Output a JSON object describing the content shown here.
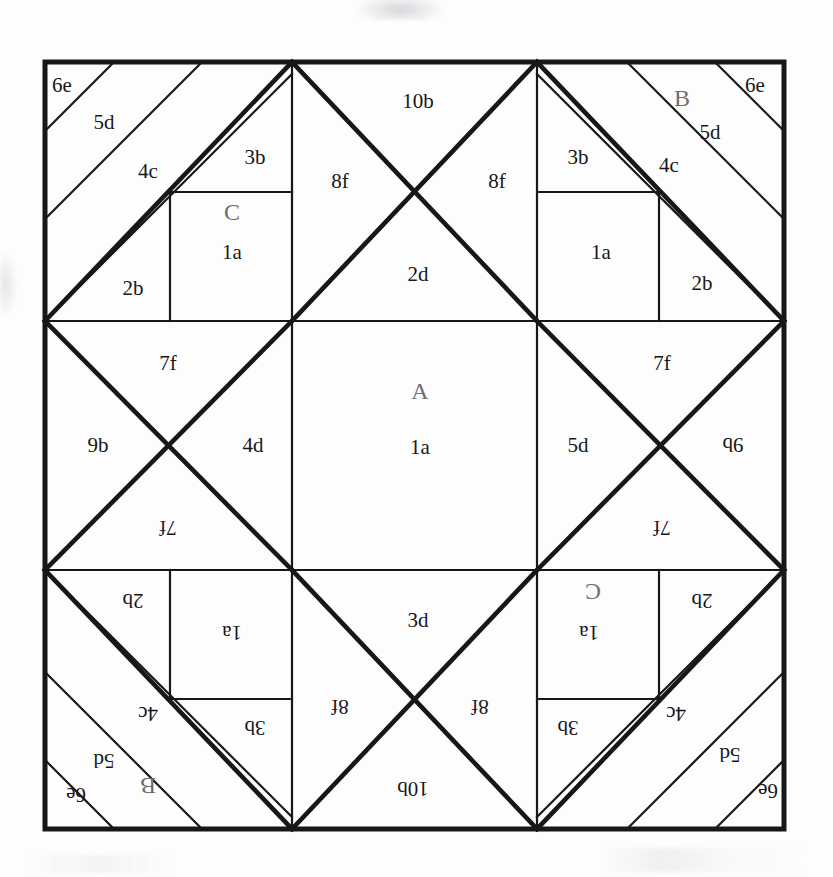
{
  "diagram": {
    "type": "geometric-tiling",
    "canvas": {
      "width": 833,
      "height": 877
    },
    "square": {
      "x": 45,
      "y": 62,
      "size": 739,
      "cells": 3,
      "cell_size": 246.33
    },
    "colors": {
      "background": "#ffffff",
      "line": "#17171a",
      "label": "#17171a",
      "group_label": "#6d6d72"
    },
    "group_labels": [
      "A",
      "B",
      "C"
    ],
    "piece_codes": [
      "1a",
      "2b",
      "2d",
      "3b",
      "3d",
      "4c",
      "4d",
      "5d",
      "6e",
      "7f",
      "8f",
      "9b",
      "10b"
    ],
    "labels": [
      {
        "id": "tl-6e",
        "text": "6e",
        "x": 62,
        "y": 92,
        "rot": 0,
        "style": "lbl"
      },
      {
        "id": "tl-5d",
        "text": "5d",
        "x": 104,
        "y": 129,
        "rot": 0,
        "style": "lbl"
      },
      {
        "id": "tl-4c",
        "text": "4c",
        "x": 148,
        "y": 178,
        "rot": 0,
        "style": "lbl"
      },
      {
        "id": "tl-3b",
        "text": "3b",
        "x": 255,
        "y": 164,
        "rot": 0,
        "style": "lbl"
      },
      {
        "id": "tl-C",
        "text": "C",
        "x": 232,
        "y": 220,
        "rot": 0,
        "style": "lbl-big"
      },
      {
        "id": "tl-1a",
        "text": "1a",
        "x": 232,
        "y": 259,
        "rot": 0,
        "style": "lbl"
      },
      {
        "id": "tl-2b",
        "text": "2b",
        "x": 133,
        "y": 295,
        "rot": 0,
        "style": "lbl"
      },
      {
        "id": "tc-10b",
        "text": "10b",
        "x": 418,
        "y": 108,
        "rot": 0,
        "style": "lbl"
      },
      {
        "id": "tc-8fL",
        "text": "8f",
        "x": 340,
        "y": 188,
        "rot": 0,
        "style": "lbl"
      },
      {
        "id": "tc-8fR",
        "text": "8f",
        "x": 497,
        "y": 188,
        "rot": 0,
        "style": "lbl"
      },
      {
        "id": "tc-2d",
        "text": "2d",
        "x": 418,
        "y": 281,
        "rot": 0,
        "style": "lbl"
      },
      {
        "id": "tr-6e",
        "text": "6e",
        "x": 755,
        "y": 92,
        "rot": 0,
        "style": "lbl"
      },
      {
        "id": "tr-B",
        "text": "B",
        "x": 682,
        "y": 106,
        "rot": 0,
        "style": "lbl-big"
      },
      {
        "id": "tr-5d",
        "text": "5d",
        "x": 710,
        "y": 139,
        "rot": 0,
        "style": "lbl"
      },
      {
        "id": "tr-4c",
        "text": "4c",
        "x": 669,
        "y": 172,
        "rot": 0,
        "style": "lbl"
      },
      {
        "id": "tr-3b",
        "text": "3b",
        "x": 578,
        "y": 164,
        "rot": 0,
        "style": "lbl"
      },
      {
        "id": "tr-1a",
        "text": "1a",
        "x": 601,
        "y": 259,
        "rot": 0,
        "style": "lbl"
      },
      {
        "id": "tr-2b",
        "text": "2b",
        "x": 702,
        "y": 290,
        "rot": 0,
        "style": "lbl"
      },
      {
        "id": "ml-7f",
        "text": "7f",
        "x": 168,
        "y": 370,
        "rot": 0,
        "style": "lbl"
      },
      {
        "id": "ml-9b",
        "text": "9b",
        "x": 98,
        "y": 452,
        "rot": 0,
        "style": "lbl"
      },
      {
        "id": "ml-4d",
        "text": "4d",
        "x": 253,
        "y": 452,
        "rot": 0,
        "style": "lbl"
      },
      {
        "id": "ml-7fr",
        "text": "7f",
        "x": 168,
        "y": 535,
        "rot": 180,
        "style": "lbl"
      },
      {
        "id": "mc-A",
        "text": "A",
        "x": 420,
        "y": 399,
        "rot": 0,
        "style": "lbl-big"
      },
      {
        "id": "mc-1a",
        "text": "1a",
        "x": 420,
        "y": 454,
        "rot": 0,
        "style": "lbl"
      },
      {
        "id": "mr-7f",
        "text": "7f",
        "x": 662,
        "y": 370,
        "rot": 0,
        "style": "lbl"
      },
      {
        "id": "mr-5d",
        "text": "5d",
        "x": 578,
        "y": 452,
        "rot": 0,
        "style": "lbl"
      },
      {
        "id": "mr-9b",
        "text": "9b",
        "x": 733,
        "y": 452,
        "rot": 180,
        "style": "lbl"
      },
      {
        "id": "mr-7fr",
        "text": "7f",
        "x": 662,
        "y": 535,
        "rot": 180,
        "style": "lbl"
      },
      {
        "id": "bl-2b",
        "text": "2b",
        "x": 133,
        "y": 608,
        "rot": 180,
        "style": "lbl"
      },
      {
        "id": "bl-1a",
        "text": "1a",
        "x": 232,
        "y": 640,
        "rot": 180,
        "style": "lbl"
      },
      {
        "id": "bl-3b",
        "text": "3b",
        "x": 255,
        "y": 735,
        "rot": 180,
        "style": "lbl"
      },
      {
        "id": "bl-4c",
        "text": "4c",
        "x": 148,
        "y": 721,
        "rot": 180,
        "style": "lbl"
      },
      {
        "id": "bl-5d",
        "text": "5d",
        "x": 104,
        "y": 768,
        "rot": 180,
        "style": "lbl"
      },
      {
        "id": "bl-B",
        "text": "B",
        "x": 148,
        "y": 792,
        "rot": 180,
        "style": "lbl-big"
      },
      {
        "id": "bl-6e",
        "text": "6e",
        "x": 76,
        "y": 802,
        "rot": 180,
        "style": "lbl"
      },
      {
        "id": "bc-3d",
        "text": "3d",
        "x": 418,
        "y": 627,
        "rot": 0,
        "style": "lbl"
      },
      {
        "id": "bc-8fL",
        "text": "8f",
        "x": 340,
        "y": 714,
        "rot": 180,
        "style": "lbl"
      },
      {
        "id": "bc-8fR",
        "text": "8f",
        "x": 480,
        "y": 714,
        "rot": 180,
        "style": "lbl"
      },
      {
        "id": "bc-10b",
        "text": "10b",
        "x": 413,
        "y": 796,
        "rot": 180,
        "style": "lbl"
      },
      {
        "id": "br-2b",
        "text": "2b",
        "x": 702,
        "y": 608,
        "rot": 180,
        "style": "lbl"
      },
      {
        "id": "br-C",
        "text": "C",
        "x": 593,
        "y": 598,
        "rot": 180,
        "style": "lbl-big"
      },
      {
        "id": "br-1a",
        "text": "1a",
        "x": 589,
        "y": 640,
        "rot": 180,
        "style": "lbl"
      },
      {
        "id": "br-3b",
        "text": "3b",
        "x": 568,
        "y": 735,
        "rot": 180,
        "style": "lbl"
      },
      {
        "id": "br-4c",
        "text": "4c",
        "x": 676,
        "y": 721,
        "rot": 180,
        "style": "lbl"
      },
      {
        "id": "br-5d",
        "text": "5d",
        "x": 730,
        "y": 762,
        "rot": 180,
        "style": "lbl"
      },
      {
        "id": "br-6e",
        "text": "6e",
        "x": 768,
        "y": 798,
        "rot": 180,
        "style": "lbl"
      }
    ]
  }
}
